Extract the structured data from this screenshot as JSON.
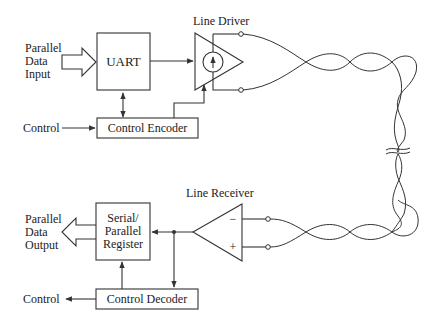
{
  "diagram": {
    "title": "",
    "blocks": {
      "uart": {
        "label": "UART"
      },
      "control_encoder": {
        "label": "Control Encoder"
      },
      "line_driver": {
        "label": "Line Driver"
      },
      "line_receiver": {
        "label": "Line Receiver",
        "minus": "−",
        "plus": "+"
      },
      "sp_register": {
        "line1": "Serial/",
        "line2": "Parallel",
        "line3": "Register"
      },
      "control_decoder": {
        "label": "Control Decoder"
      }
    },
    "io": {
      "input": {
        "line1": "Parallel",
        "line2": "Data",
        "line3": "Input"
      },
      "output": {
        "line1": "Parallel",
        "line2": "Data",
        "line3": "Output"
      },
      "control_in": "Control",
      "control_out": "Control"
    },
    "colors": {
      "ink": "#333333",
      "background": "#ffffff"
    }
  }
}
